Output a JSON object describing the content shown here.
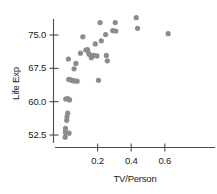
{
  "chart_data": {
    "type": "scatter",
    "title": "",
    "xlabel": "TV/Person",
    "ylabel": "Life Exp",
    "xlim": [
      -0.02,
      0.8
    ],
    "ylim": [
      50.5,
      79.5
    ],
    "xticks": [
      0.2,
      0.4,
      0.6
    ],
    "xtick_labels": [
      "0.2",
      "0.4",
      "0.6"
    ],
    "yticks": [
      52.5,
      60.0,
      67.5,
      75.0
    ],
    "ytick_labels": [
      "52.5",
      "60.0",
      "67.5",
      "75.0"
    ],
    "grid": false,
    "legend": null,
    "marker": {
      "shape": "circle",
      "color": "#8c8c8c",
      "size": 2.6
    },
    "axis_color": "#4d4d4d",
    "points": [
      {
        "x": 0.007,
        "y": 52.0
      },
      {
        "x": 0.008,
        "y": 53.2
      },
      {
        "x": 0.009,
        "y": 54.0
      },
      {
        "x": 0.012,
        "y": 53.0
      },
      {
        "x": 0.016,
        "y": 55.8
      },
      {
        "x": 0.018,
        "y": 56.6
      },
      {
        "x": 0.022,
        "y": 57.4
      },
      {
        "x": 0.03,
        "y": 52.9
      },
      {
        "x": 0.01,
        "y": 60.6
      },
      {
        "x": 0.022,
        "y": 60.7
      },
      {
        "x": 0.033,
        "y": 60.4
      },
      {
        "x": 0.028,
        "y": 65.0
      },
      {
        "x": 0.04,
        "y": 64.9
      },
      {
        "x": 0.048,
        "y": 64.8
      },
      {
        "x": 0.055,
        "y": 64.7
      },
      {
        "x": 0.063,
        "y": 64.7
      },
      {
        "x": 0.078,
        "y": 64.6
      },
      {
        "x": 0.026,
        "y": 69.6
      },
      {
        "x": 0.06,
        "y": 67.4
      },
      {
        "x": 0.071,
        "y": 68.6
      },
      {
        "x": 0.098,
        "y": 70.9
      },
      {
        "x": 0.112,
        "y": 74.6
      },
      {
        "x": 0.13,
        "y": 71.6
      },
      {
        "x": 0.14,
        "y": 71.7
      },
      {
        "x": 0.148,
        "y": 70.8
      },
      {
        "x": 0.152,
        "y": 70.6
      },
      {
        "x": 0.163,
        "y": 69.9
      },
      {
        "x": 0.178,
        "y": 70.4
      },
      {
        "x": 0.186,
        "y": 73.0
      },
      {
        "x": 0.196,
        "y": 70.3
      },
      {
        "x": 0.205,
        "y": 64.8
      },
      {
        "x": 0.215,
        "y": 77.8
      },
      {
        "x": 0.222,
        "y": 73.7
      },
      {
        "x": 0.248,
        "y": 75.1
      },
      {
        "x": 0.252,
        "y": 70.4
      },
      {
        "x": 0.258,
        "y": 69.2
      },
      {
        "x": 0.29,
        "y": 76.0
      },
      {
        "x": 0.305,
        "y": 77.8
      },
      {
        "x": 0.308,
        "y": 75.9
      },
      {
        "x": 0.43,
        "y": 78.9
      },
      {
        "x": 0.438,
        "y": 76.5
      },
      {
        "x": 0.62,
        "y": 75.3
      }
    ]
  },
  "axes": {
    "x_axis_name": "x-axis",
    "y_axis_name": "y-axis"
  }
}
